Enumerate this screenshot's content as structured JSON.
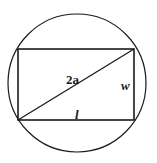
{
  "diagram": {
    "labels": {
      "diagonal": "2a",
      "width": "w",
      "length": "l"
    },
    "colors": {
      "stroke": "#1a1a1a",
      "background": "#ffffff"
    }
  }
}
